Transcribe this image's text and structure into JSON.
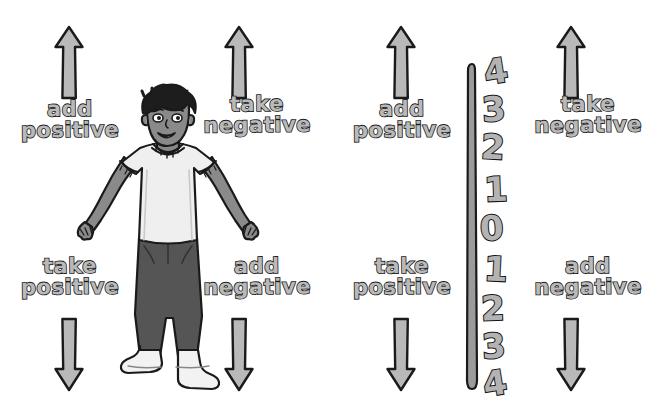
{
  "diagram": {
    "background_color": "#ffffff",
    "ink_color": "#1a1a1a",
    "fill_color": "#b9b9b9"
  },
  "left_panel": {
    "name": "person-panel",
    "labels": {
      "top_left": {
        "line1": "add",
        "line2": "positive"
      },
      "top_right": {
        "line1": "take",
        "line2": "negative"
      },
      "bottom_left": {
        "line1": "take",
        "line2": "positive"
      },
      "bottom_right": {
        "line1": "add",
        "line2": "negative"
      }
    },
    "arrows": [
      {
        "name": "arrow-up-left",
        "direction": "up"
      },
      {
        "name": "arrow-up-right",
        "direction": "up"
      },
      {
        "name": "arrow-down-left",
        "direction": "down"
      },
      {
        "name": "arrow-down-right",
        "direction": "down"
      }
    ],
    "figure": {
      "name": "standing-person",
      "description": "person standing with arms outstretched",
      "hair_color": "#1d1d1d",
      "skin_color": "#8a8a8a",
      "shirt_color": "#efefef",
      "pants_color": "#555555",
      "shoe_color": "#f2f2f2"
    }
  },
  "right_panel": {
    "name": "numberline-panel",
    "labels": {
      "top_left": {
        "line1": "add",
        "line2": "positive"
      },
      "top_right": {
        "line1": "take",
        "line2": "negative"
      },
      "bottom_left": {
        "line1": "take",
        "line2": "positive"
      },
      "bottom_right": {
        "line1": "add",
        "line2": "negative"
      }
    },
    "arrows": [
      {
        "name": "arrow-up-left",
        "direction": "up"
      },
      {
        "name": "arrow-up-right",
        "direction": "up"
      },
      {
        "name": "arrow-down-left",
        "direction": "down"
      },
      {
        "name": "arrow-down-right",
        "direction": "down"
      }
    ],
    "number_line": {
      "name": "vertical-number-line",
      "orientation": "vertical",
      "ticks": [
        "4",
        "3",
        "2",
        "1",
        "0",
        "1",
        "2",
        "3",
        "4"
      ]
    }
  }
}
